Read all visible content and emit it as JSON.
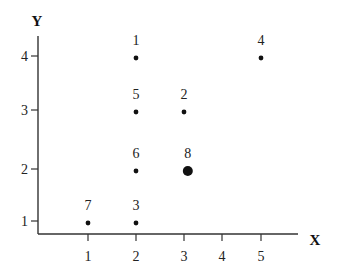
{
  "chart_data": {
    "type": "scatter",
    "title": "",
    "xlabel": "X",
    "ylabel": "Y",
    "x_ticks": [
      1,
      2,
      3,
      4,
      5
    ],
    "y_ticks": [
      1,
      2,
      3,
      4
    ],
    "xlim": [
      0,
      5.8
    ],
    "ylim": [
      0.75,
      4.35
    ],
    "grid": false,
    "legend": null,
    "points": [
      {
        "label": "1",
        "x": 2,
        "y": 4,
        "size": "small"
      },
      {
        "label": "2",
        "x": 3,
        "y": 3,
        "size": "small"
      },
      {
        "label": "3",
        "x": 2,
        "y": 1,
        "size": "small"
      },
      {
        "label": "4",
        "x": 5,
        "y": 4,
        "size": "small"
      },
      {
        "label": "5",
        "x": 2,
        "y": 3,
        "size": "small"
      },
      {
        "label": "6",
        "x": 2,
        "y": 2,
        "size": "small"
      },
      {
        "label": "7",
        "x": 1,
        "y": 1,
        "size": "small"
      },
      {
        "label": "8",
        "x": 3.1,
        "y": 2,
        "size": "large"
      }
    ]
  },
  "layout_px": {
    "x_tick_px": {
      "1": 88,
      "2": 136,
      "3": 184,
      "4": 222,
      "5": 261
    },
    "y_tick_px": {
      "1": 221,
      "2": 169,
      "3": 110,
      "4": 56
    },
    "axis_origin": [
      38,
      234
    ],
    "x_axis_end": 298,
    "y_axis_top": 36
  }
}
